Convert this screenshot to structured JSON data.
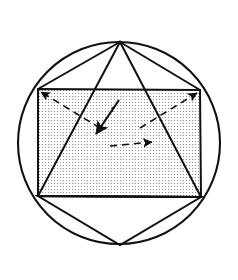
{
  "figure": {
    "background_color": "#ffffff",
    "stroke_color": "#111111",
    "fill_pattern": "stipple-dots",
    "fill_pattern_color": "#9a9a9a",
    "width": 238,
    "height": 280
  },
  "circle": {
    "label": "circumscribed-circle",
    "cx": 119,
    "cy": 143,
    "r": 101,
    "stroke_width": 2.1
  },
  "square": {
    "label": "inscribed-square",
    "corners": [
      {
        "name": "top-left",
        "x": 38,
        "y": 89
      },
      {
        "name": "top-right",
        "x": 200,
        "y": 90
      },
      {
        "name": "bottom-right",
        "x": 201,
        "y": 197
      },
      {
        "name": "bottom-left",
        "x": 38,
        "y": 196
      }
    ],
    "stroke_width": 2.0
  },
  "triangle": {
    "label": "inscribed-triangle",
    "vertices": [
      {
        "name": "apex",
        "x": 120,
        "y": 42
      },
      {
        "name": "base-left",
        "x": 38,
        "y": 196
      },
      {
        "name": "base-right",
        "x": 201,
        "y": 197
      }
    ],
    "stroke_width": 2.0
  },
  "lower_triangle": {
    "label": "lower-triangle",
    "vertices": [
      {
        "name": "base-left",
        "x": 38,
        "y": 196
      },
      {
        "name": "base-right",
        "x": 201,
        "y": 197
      },
      {
        "name": "bottom-vertex",
        "x": 120,
        "y": 245
      }
    ],
    "stroke_width": 2.0
  },
  "apex_rays": {
    "label": "apex-rays",
    "from": {
      "x": 120,
      "y": 42
    },
    "to": [
      {
        "x": 38,
        "y": 89
      },
      {
        "x": 200,
        "y": 90
      }
    ]
  },
  "radius_arrows": [
    {
      "name": "radius-arrow-upper-left",
      "from": {
        "x": 100,
        "y": 128
      },
      "to": {
        "x": 41,
        "y": 92
      },
      "dashed": true,
      "head_at": "to"
    },
    {
      "name": "radius-arrow-upper-right",
      "from": {
        "x": 140,
        "y": 128
      },
      "to": {
        "x": 197,
        "y": 93
      },
      "dashed": true,
      "head_at": "to"
    },
    {
      "name": "radius-arrow-center-down",
      "from": {
        "x": 119,
        "y": 100
      },
      "to": {
        "x": 96,
        "y": 134
      },
      "dashed": false,
      "head_at": "to"
    },
    {
      "name": "radius-arrow-horizontal",
      "from": {
        "x": 110,
        "y": 146
      },
      "to": {
        "x": 152,
        "y": 142
      },
      "dashed": true,
      "head_at": "to"
    }
  ],
  "labels": [
    {
      "name": "radius-label-r",
      "text": "r",
      "x": 111,
      "y": 112
    }
  ]
}
